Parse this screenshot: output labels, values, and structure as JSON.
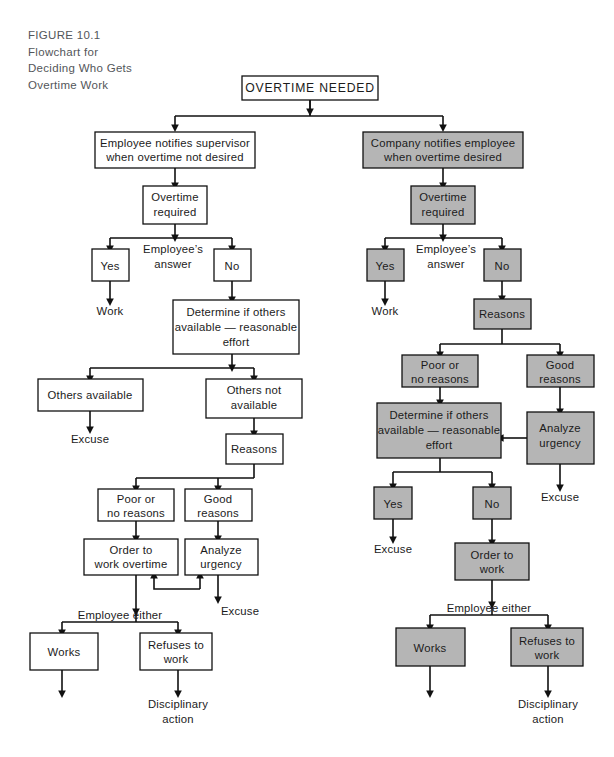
{
  "figure": {
    "caption_lines": [
      "FIGURE 10.1",
      "Flowchart for",
      "Deciding Who Gets",
      "Overtime Work"
    ],
    "caption_color": "#53565a"
  },
  "colors": {
    "shaded_fill": "#b5b5b5",
    "plain_fill": "#ffffff",
    "stroke": "#111111",
    "text": "#1b1b1b"
  },
  "root": {
    "label": "OVERTIME NEEDED"
  },
  "left_branch": {
    "name": "employee-initiated",
    "start": {
      "line1": "Employee notifies supervisor",
      "line2": "when overtime not desired"
    },
    "overtime_required": {
      "line1": "Overtime",
      "line2": "required"
    },
    "decision_label": {
      "line1": "Employee’s",
      "line2": "answer"
    },
    "yes": "Yes",
    "no": "No",
    "work_outcome": "Work",
    "determine": {
      "line1": "Determine if others",
      "line2": "available — reasonable",
      "line3": "effort"
    },
    "others_available": "Others available",
    "others_not_available": {
      "line1": "Others not",
      "line2": "available"
    },
    "excuse_available": "Excuse",
    "reasons": "Reasons",
    "poor_reasons": {
      "line1": "Poor or",
      "line2": "no reasons"
    },
    "good_reasons": {
      "line1": "Good",
      "line2": "reasons"
    },
    "order_to_work": {
      "line1": "Order to",
      "line2": "work overtime"
    },
    "analyze_urgency": {
      "line1": "Analyze",
      "line2": "urgency"
    },
    "excuse_urgency": "Excuse",
    "employee_either": "Employee either",
    "works": "Works",
    "refuses": {
      "line1": "Refuses to",
      "line2": "work"
    },
    "disciplinary": {
      "line1": "Disciplinary",
      "line2": "action"
    }
  },
  "right_branch": {
    "name": "company-initiated",
    "start": {
      "line1": "Company notifies employee",
      "line2": "when overtime desired"
    },
    "overtime_required": {
      "line1": "Overtime",
      "line2": "required"
    },
    "decision_label": {
      "line1": "Employee’s",
      "line2": "answer"
    },
    "yes": "Yes",
    "no": "No",
    "work_outcome": "Work",
    "reasons": "Reasons",
    "poor_reasons": {
      "line1": "Poor or",
      "line2": "no reasons"
    },
    "good_reasons": {
      "line1": "Good",
      "line2": "reasons"
    },
    "determine": {
      "line1": "Determine if others",
      "line2": "available — reasonable",
      "line3": "effort"
    },
    "analyze_urgency": {
      "line1": "Analyze",
      "line2": "urgency"
    },
    "excuse_urgency": "Excuse",
    "yes2": "Yes",
    "no2": "No",
    "excuse_yes2": "Excuse",
    "order_to_work": {
      "line1": "Order to",
      "line2": "work"
    },
    "employee_either": "Employee either",
    "works": "Works",
    "refuses": {
      "line1": "Refuses to",
      "line2": "work"
    },
    "disciplinary": {
      "line1": "Disciplinary",
      "line2": "action"
    }
  }
}
